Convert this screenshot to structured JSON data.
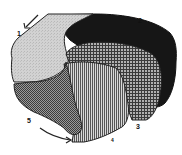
{
  "diagram": {
    "regions": [
      {
        "id": "1",
        "label": "1",
        "fill": "light-stipple",
        "color": "#cfcfcf",
        "position": "top-left"
      },
      {
        "id": "2",
        "label": "2",
        "fill": "solid-black",
        "color": "#161616",
        "position": "top-right"
      },
      {
        "id": "3",
        "label": "3",
        "fill": "crosshatch-grid",
        "color": "#8a8a8a",
        "position": "middle-right"
      },
      {
        "id": "4",
        "label": "4",
        "fill": "vertical-stripes",
        "color": "#9a9a9a",
        "position": "center-bottom"
      },
      {
        "id": "5",
        "label": "5",
        "fill": "dark-checker",
        "color": "#6e6e6e",
        "position": "bottom-left"
      }
    ],
    "arrows": [
      {
        "name": "top-left-arrow",
        "direction": "down-left"
      },
      {
        "name": "bottom-arrow",
        "direction": "right"
      }
    ]
  }
}
